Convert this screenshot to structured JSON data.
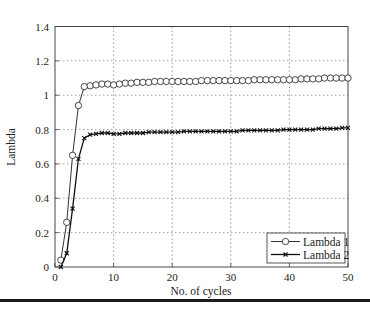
{
  "chart_data": {
    "type": "line",
    "title": "",
    "xlabel": "No. of cycles",
    "ylabel": "Lambda",
    "xlim": [
      0,
      50
    ],
    "ylim": [
      0,
      1.4
    ],
    "xticks": [
      0,
      10,
      20,
      30,
      40,
      50
    ],
    "yticks": [
      0,
      0.2,
      0.4,
      0.6,
      0.8,
      1,
      1.2,
      1.4
    ],
    "xtick_labels": [
      "0",
      "10",
      "20",
      "30",
      "40",
      "50"
    ],
    "ytick_labels": [
      "0",
      "0.2",
      "0.4",
      "0.6",
      "0.8",
      "1",
      "1.2",
      "1.4"
    ],
    "grid": true,
    "legend_position": "lower right",
    "x": [
      1,
      2,
      3,
      4,
      5,
      6,
      7,
      8,
      9,
      10,
      11,
      12,
      13,
      14,
      15,
      16,
      17,
      18,
      19,
      20,
      21,
      22,
      23,
      24,
      25,
      26,
      27,
      28,
      29,
      30,
      31,
      32,
      33,
      34,
      35,
      36,
      37,
      38,
      39,
      40,
      41,
      42,
      43,
      44,
      45,
      46,
      47,
      48,
      49,
      50
    ],
    "series": [
      {
        "name": "Lambda 1",
        "marker": "circle",
        "color": "#333333",
        "values": [
          0.04,
          0.26,
          0.65,
          0.94,
          1.05,
          1.055,
          1.06,
          1.065,
          1.065,
          1.06,
          1.065,
          1.07,
          1.07,
          1.075,
          1.075,
          1.075,
          1.08,
          1.08,
          1.08,
          1.08,
          1.08,
          1.08,
          1.08,
          1.08,
          1.085,
          1.085,
          1.085,
          1.085,
          1.085,
          1.085,
          1.085,
          1.085,
          1.085,
          1.09,
          1.09,
          1.09,
          1.09,
          1.09,
          1.09,
          1.09,
          1.09,
          1.095,
          1.095,
          1.095,
          1.095,
          1.1,
          1.1,
          1.1,
          1.1,
          1.1
        ]
      },
      {
        "name": "Lambda 2",
        "marker": "x",
        "color": "#111111",
        "values": [
          0.0,
          0.08,
          0.34,
          0.63,
          0.75,
          0.77,
          0.775,
          0.78,
          0.78,
          0.775,
          0.775,
          0.78,
          0.78,
          0.78,
          0.78,
          0.785,
          0.785,
          0.785,
          0.785,
          0.785,
          0.785,
          0.79,
          0.79,
          0.79,
          0.79,
          0.79,
          0.79,
          0.79,
          0.79,
          0.79,
          0.79,
          0.795,
          0.795,
          0.795,
          0.795,
          0.795,
          0.795,
          0.795,
          0.8,
          0.8,
          0.8,
          0.8,
          0.8,
          0.8,
          0.805,
          0.805,
          0.805,
          0.805,
          0.81,
          0.81
        ]
      }
    ]
  }
}
